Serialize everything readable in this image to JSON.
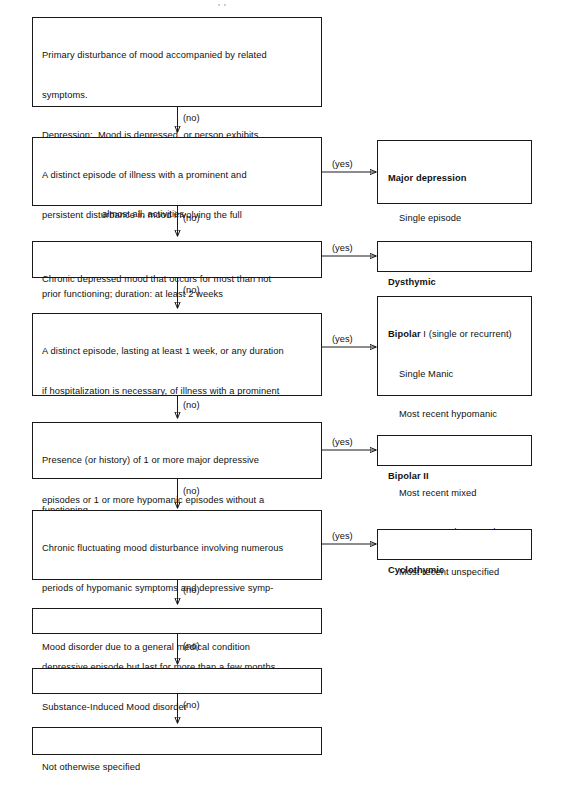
{
  "diagram": {
    "yes_label": "(yes)",
    "no_label": "(no)",
    "decisions": [
      {
        "id": "primary-disturbance",
        "lines": [
          {
            "text": "Primary disturbance of mood accompanied by related",
            "indent": 0
          },
          {
            "text": "symptoms.",
            "indent": 0
          },
          {
            "text": "Depression:  Mood is depressed, or person exhibits",
            "indent": 0
          },
          {
            "text": "loss of interest or pleasure in all, or",
            "indent": 2
          },
          {
            "text": "almost all, activities",
            "indent": 2
          },
          {
            "text": "Mania: Mood is elevated, expansive, or irritable",
            "indent": 0
          }
        ]
      },
      {
        "id": "major-depression-criteria",
        "lines": [
          {
            "text": "A distinct episode of illness with a prominent and",
            "indent": 0
          },
          {
            "text": "persistent disturbance in mood involving the full",
            "indent": 0
          },
          {
            "text": "depressive syndrome, clearly distinguished from",
            "indent": 0
          },
          {
            "text": "prior functioning; duration: at least 2 weeks",
            "indent": 0
          }
        ]
      },
      {
        "id": "dysthymic-criteria",
        "lines": [
          {
            "text": "Chronic depressed mood that occurs for most than not",
            "indent": 0
          },
          {
            "text": "for at least 2 years",
            "indent": 0
          }
        ]
      },
      {
        "id": "bipolar-one-criteria",
        "lines": [
          {
            "text": "A distinct episode, lasting at least 1 week, or any duration",
            "indent": 0
          },
          {
            "text": "if hospitalization is necessary, of illness with a prominent",
            "indent": 0
          },
          {
            "text": "and persistent disturbance in mood involving the full",
            "indent": 0
          },
          {
            "text": "manic syndrome, clearly distinguished from prior",
            "indent": 0
          },
          {
            "text": "functioning",
            "indent": 0
          }
        ]
      },
      {
        "id": "bipolar-two-criteria",
        "lines": [
          {
            "text": "Presence (or history) of 1 or more major depressive",
            "indent": 0
          },
          {
            "text": "episodes or 1 or more hypomanic episodes without a",
            "indent": 0
          },
          {
            "text": "presence of a manic episode",
            "indent": 0
          }
        ]
      },
      {
        "id": "cyclothymic-criteria",
        "lines": [
          {
            "text": "Chronic fluctuating mood disturbance involving numerous",
            "indent": 0
          },
          {
            "text": "periods of hypomanic symptoms and depressive symp-",
            "indent": 0
          },
          {
            "text": "toms that do not meet full criteria of either a manic or",
            "indent": 0
          },
          {
            "text": "depressive episode but last for more than a few months",
            "indent": 0
          }
        ]
      },
      {
        "id": "general-medical-condition",
        "lines": [
          {
            "text": "Mood disorder due to a general medical condition",
            "indent": 0
          }
        ]
      },
      {
        "id": "substance-induced",
        "lines": [
          {
            "text": "Substance-Induced Mood disorder",
            "indent": 0
          }
        ]
      },
      {
        "id": "not-otherwise-specified",
        "lines": [
          {
            "text": "Not otherwise specified",
            "indent": 0
          }
        ]
      }
    ],
    "outcomes": [
      {
        "id": "major-depression",
        "heading": "Major depression",
        "heading_suffix": "",
        "items": [
          "Single episode",
          "Recurrent"
        ]
      },
      {
        "id": "dysthymic",
        "heading": "Dysthymic",
        "heading_suffix": "",
        "items": []
      },
      {
        "id": "bipolar-one",
        "heading": "Bipolar",
        "heading_suffix": " I (single or recurrent)",
        "items": [
          "Single Manic",
          "Most recent hypomanic",
          "Most recent manic",
          "Most recent mixed",
          "Most recent depressed",
          "Most recent unspecified"
        ]
      },
      {
        "id": "bipolar-two",
        "heading": "Bipolar II",
        "heading_suffix": "",
        "items": []
      },
      {
        "id": "cyclothymic",
        "heading": "Cyclothymic",
        "heading_suffix": "",
        "items": []
      }
    ],
    "colors": {
      "stroke": "#1a1a1a",
      "text": "#111111",
      "background": "#ffffff"
    }
  }
}
